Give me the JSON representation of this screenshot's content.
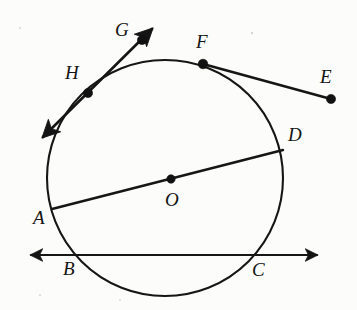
{
  "figure": {
    "background_color": "#fcfcfa",
    "ink_color": "#161616",
    "width": 357,
    "height": 310
  },
  "circle": {
    "name": "circle-O",
    "center": {
      "x": 165,
      "y": 178
    },
    "radius": 118,
    "stroke_width": 2.1
  },
  "points": [
    {
      "id": "O",
      "label": "O",
      "x": 171,
      "y": 179,
      "label_x": 165,
      "label_y": 190,
      "dot": true,
      "dot_r": 4.2,
      "role": "center"
    },
    {
      "id": "G",
      "label": "G",
      "x": 142,
      "y": 40,
      "label_x": 115,
      "label_y": 20,
      "dot": true,
      "dot_r": 4.6,
      "role": "exterior-on-secant"
    },
    {
      "id": "H",
      "label": "H",
      "x": 88,
      "y": 93,
      "label_x": 65,
      "label_y": 63,
      "dot": true,
      "dot_r": 4.6,
      "role": "on-circle-secant"
    },
    {
      "id": "F",
      "label": "F",
      "x": 203,
      "y": 64,
      "label_x": 196,
      "label_y": 32,
      "dot": true,
      "dot_r": 4.8,
      "role": "on-circle-tangent"
    },
    {
      "id": "E",
      "label": "E",
      "x": 331,
      "y": 99,
      "label_x": 320,
      "label_y": 67,
      "dot": true,
      "dot_r": 4.6,
      "role": "exterior-endpoint"
    },
    {
      "id": "D",
      "label": "D",
      "x": 280,
      "y": 153,
      "label_x": 288,
      "label_y": 125,
      "dot": false,
      "dot_r": 0,
      "role": "on-circle-diameter"
    },
    {
      "id": "A",
      "label": "A",
      "x": 58,
      "y": 207,
      "label_x": 33,
      "label_y": 208,
      "dot": false,
      "dot_r": 0,
      "role": "on-circle-diameter"
    },
    {
      "id": "B",
      "label": "B",
      "x": 75,
      "y": 255,
      "label_x": 63,
      "label_y": 259,
      "dot": false,
      "dot_r": 0,
      "role": "on-circle-line-bc"
    },
    {
      "id": "C",
      "label": "C",
      "x": 259,
      "y": 255,
      "label_x": 252,
      "label_y": 260,
      "dot": false,
      "dot_r": 0,
      "role": "on-circle-line-bc"
    }
  ],
  "lines": [
    {
      "id": "secant-HG",
      "name": "secant-line-through-h-and-g",
      "from": {
        "x": 43,
        "y": 137
      },
      "to": {
        "x": 152,
        "y": 29
      },
      "stroke_width": 2.6,
      "arrow_start": true,
      "arrow_end": true
    },
    {
      "id": "segment-FE",
      "name": "tangent-segment-f-to-e",
      "from": {
        "x": 203,
        "y": 64
      },
      "to": {
        "x": 331,
        "y": 99
      },
      "stroke_width": 2.6,
      "arrow_start": false,
      "arrow_end": false
    },
    {
      "id": "diameter-AD",
      "name": "diameter-a-to-d",
      "from": {
        "x": 52,
        "y": 209
      },
      "to": {
        "x": 283,
        "y": 150
      },
      "stroke_width": 2.4,
      "arrow_start": false,
      "arrow_end": false
    },
    {
      "id": "line-BC",
      "name": "line-b-to-c",
      "from": {
        "x": 31,
        "y": 255
      },
      "to": {
        "x": 317,
        "y": 255
      },
      "stroke_width": 1.9,
      "arrow_start": true,
      "arrow_end": true
    }
  ],
  "labels": {
    "A": "A",
    "B": "B",
    "C": "C",
    "D": "D",
    "E": "E",
    "F": "F",
    "G": "G",
    "H": "H",
    "O": "O"
  }
}
